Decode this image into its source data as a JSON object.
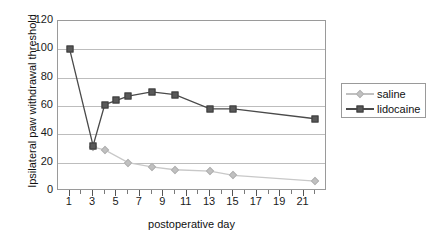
{
  "chart_data": {
    "type": "line",
    "title": "",
    "xlabel": "postoperative day",
    "ylabel": "Ipsilateral paw withdrawal threshold",
    "x": [
      1,
      3,
      4,
      5,
      6,
      8,
      10,
      13,
      15,
      22
    ],
    "xlim": [
      0,
      23
    ],
    "ylim": [
      0,
      120
    ],
    "xticks": [
      "1",
      "3",
      "5",
      "7",
      "9",
      "11",
      "13",
      "15",
      "17",
      "19",
      "21"
    ],
    "yticks": [
      "0",
      "20",
      "40",
      "60",
      "80",
      "100",
      "120"
    ],
    "grid": "horizontal",
    "legend_position": "right",
    "series": [
      {
        "name": "saline",
        "color": "#c0c0c0",
        "marker": "diamond",
        "x": [
          3,
          4,
          6,
          8,
          10,
          13,
          15,
          22
        ],
        "values": [
          31,
          29,
          20,
          17,
          15,
          14,
          11,
          7
        ]
      },
      {
        "name": "lidocaine",
        "color": "#595959",
        "marker": "square",
        "x": [
          1,
          3,
          4,
          5,
          6,
          8,
          10,
          13,
          15,
          22
        ],
        "values": [
          100,
          32,
          61,
          64,
          67,
          70,
          68,
          58,
          58,
          51
        ]
      }
    ]
  },
  "legend": {
    "entries": [
      {
        "label": "saline"
      },
      {
        "label": "lidocaine"
      }
    ]
  },
  "axes": {
    "y_title": "Ipsilateral paw withdrawal threshold",
    "x_title": "postoperative day"
  }
}
